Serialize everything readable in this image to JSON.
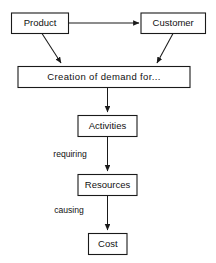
{
  "diagram": {
    "type": "flowchart",
    "background_color": "#ffffff",
    "line_color": "#1a1a1a",
    "text_color": "#111111",
    "nodes": {
      "product": {
        "label": "Product"
      },
      "customer": {
        "label": "Customer"
      },
      "creation": {
        "label": "Creation of demand for..."
      },
      "activities": {
        "label": "Activities"
      },
      "resources": {
        "label": "Resources"
      },
      "cost": {
        "label": "Cost"
      }
    },
    "edge_labels": {
      "requiring": "requiring",
      "causing": "causing"
    }
  }
}
